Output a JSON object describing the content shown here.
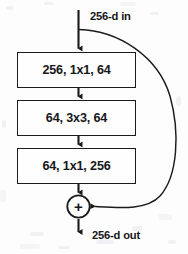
{
  "figure": {
    "type": "neural-network-block-diagram",
    "name": "ResNet bottleneck residual block",
    "background_color": "#fdfdfd",
    "stroke_color": "#1b1b1b",
    "text_color": "#17171a"
  },
  "input": {
    "label": "256-d in",
    "arrow_name": "input-arrow"
  },
  "output": {
    "label": "256-d out",
    "arrow_name": "output-arrow"
  },
  "blocks": [
    {
      "label": "256, 1x1, 64",
      "name": "conv-block-1"
    },
    {
      "label": "64, 3x3, 64",
      "name": "conv-block-2"
    },
    {
      "label": "64, 1x1, 256",
      "name": "conv-block-3"
    }
  ],
  "connectors": [
    {
      "name": "arrow-input-to-block-1"
    },
    {
      "name": "arrow-block-1-to-block-2"
    },
    {
      "name": "arrow-block-2-to-block-3"
    },
    {
      "name": "arrow-block-3-to-sum"
    },
    {
      "name": "shortcut-skip-connection-curve"
    },
    {
      "name": "arrow-sum-to-output"
    }
  ],
  "sum_node": {
    "symbol": "+",
    "name": "addition-node"
  }
}
